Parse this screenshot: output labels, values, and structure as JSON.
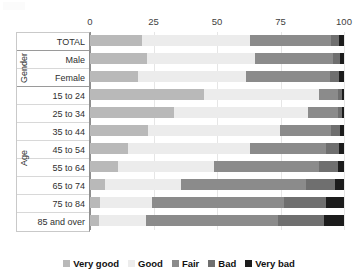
{
  "chart_data": {
    "type": "bar",
    "orientation": "horizontal",
    "stacked": true,
    "title": "",
    "xlabel": "",
    "ylabel": "",
    "xlim": [
      0,
      100
    ],
    "xticks": [
      0,
      25,
      50,
      75,
      100
    ],
    "grid": true,
    "legend_position": "bottom",
    "categories": [
      "TOTAL",
      "Male",
      "Female",
      "15 to 24",
      "25 to 34",
      "35 to 44",
      "45 to 54",
      "55 to 64",
      "65 to 74",
      "75 to 84",
      "85 and over"
    ],
    "group_labels": [
      "Gender",
      "Age"
    ],
    "series": [
      {
        "name": "Very good",
        "color": "#b9b9b9",
        "values": [
          20.5,
          22.5,
          19.0,
          45.0,
          33.0,
          23.0,
          15.0,
          11.0,
          6.0,
          4.0,
          3.5
        ]
      },
      {
        "name": "Good",
        "color": "#ececec",
        "values": [
          42.5,
          42.5,
          42.5,
          45.0,
          53.0,
          52.0,
          48.0,
          38.0,
          30.0,
          20.5,
          18.5
        ]
      },
      {
        "name": "Fair",
        "color": "#8b8b8b",
        "values": [
          32.0,
          30.5,
          33.0,
          7.5,
          11.5,
          20.0,
          30.0,
          41.0,
          49.0,
          52.0,
          52.0
        ]
      },
      {
        "name": "Bad",
        "color": "#6f6f6f",
        "values": [
          3.2,
          3.0,
          3.5,
          1.8,
          1.8,
          3.5,
          5.0,
          7.5,
          11.5,
          16.5,
          18.0
        ]
      },
      {
        "name": "Very bad",
        "color": "#1c1c1c",
        "values": [
          1.8,
          1.5,
          2.0,
          0.7,
          0.7,
          1.5,
          2.0,
          2.5,
          3.5,
          7.0,
          8.0
        ]
      }
    ]
  },
  "axis": {
    "ticks": [
      "0",
      "25",
      "50",
      "75",
      "100"
    ]
  },
  "groups": {
    "gender": "Gender",
    "age": "Age"
  },
  "legend": {
    "items": [
      {
        "label": "Very good",
        "color": "#b9b9b9"
      },
      {
        "label": "Good",
        "color": "#ececec"
      },
      {
        "label": "Fair",
        "color": "#8b8b8b"
      },
      {
        "label": "Bad",
        "color": "#6f6f6f"
      },
      {
        "label": "Very bad",
        "color": "#1c1c1c"
      }
    ]
  }
}
